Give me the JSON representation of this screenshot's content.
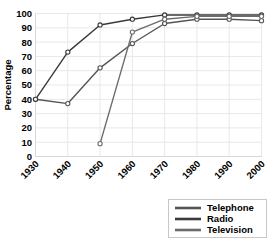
{
  "chart_data": {
    "type": "line",
    "title": "",
    "xlabel": "",
    "ylabel": "Percentage",
    "categories": [
      1930,
      1940,
      1950,
      1960,
      1970,
      1980,
      1990,
      2000
    ],
    "xtick_labels": [
      "1930",
      "1940",
      "1950",
      "1960",
      "1970",
      "1980",
      "1990",
      "2000"
    ],
    "ytick_labels": [
      "0",
      "10",
      "20",
      "30",
      "40",
      "50",
      "60",
      "70",
      "80",
      "90",
      "100"
    ],
    "ylim": [
      0,
      100
    ],
    "xlim": [
      1930,
      2000
    ],
    "grid": true,
    "legend_position": "below-right",
    "series": [
      {
        "name": "Telephone",
        "color": "#555555",
        "x": [
          1930,
          1940,
          1950,
          1960,
          1970,
          1980,
          1990,
          2000
        ],
        "values": [
          40,
          37,
          62,
          79,
          93,
          96,
          96,
          95
        ]
      },
      {
        "name": "Radio",
        "color": "#3a3a3a",
        "x": [
          1930,
          1940,
          1950,
          1960,
          1970,
          1980,
          1990,
          2000
        ],
        "values": [
          40,
          73,
          92,
          96,
          99,
          99,
          99,
          99
        ]
      },
      {
        "name": "Television",
        "color": "#6b6b6b",
        "x": [
          1950,
          1960,
          1970,
          1980,
          1990,
          2000
        ],
        "values": [
          9,
          87,
          96,
          98,
          98,
          98
        ]
      }
    ]
  },
  "legend": {
    "items": [
      {
        "label": "Telephone"
      },
      {
        "label": "Radio"
      },
      {
        "label": "Television"
      }
    ]
  }
}
